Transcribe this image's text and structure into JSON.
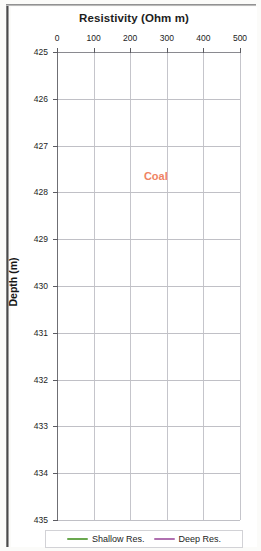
{
  "figure": {
    "title": "Resistivity (Ohm m)",
    "y_axis_title": "Depth (m)",
    "annotation": "Coal"
  },
  "legend": {
    "items": [
      {
        "label": "Shallow Res.",
        "color": "#6aa84f"
      },
      {
        "label": "Deep Res.",
        "color": "#b070b0"
      }
    ]
  },
  "colors": {
    "shallow": "#6aa84f",
    "deep": "#b070b0",
    "coal_marker": "#ef7f52",
    "coal_text": "#ef8363",
    "grid": "#c5c5cb",
    "axis": "#6f6f74"
  },
  "chart_data": {
    "type": "line",
    "title": "Resistivity (Ohm m)",
    "xlabel": "Resistivity (Ohm m)",
    "ylabel": "Depth (m)",
    "orientation": "vertical-depth",
    "xlim": [
      0,
      500
    ],
    "ylim": [
      425,
      435
    ],
    "y_inverted": true,
    "xticks": [
      0,
      100,
      200,
      300,
      400,
      500
    ],
    "yticks": [
      425,
      426,
      427,
      428,
      429,
      430,
      431,
      432,
      433,
      434,
      435
    ],
    "grid": true,
    "legend_position": "bottom",
    "annotations": [
      {
        "text": "Coal",
        "x": 270,
        "y": 427.65,
        "color": "#ef8363"
      }
    ],
    "marker_lines": [
      {
        "name": "coal-top",
        "depth": 426.85,
        "color": "#ef7f52"
      },
      {
        "name": "coal-base",
        "depth": 432.45,
        "color": "#ef7f52"
      }
    ],
    "series": [
      {
        "name": "Shallow Res.",
        "color": "#6aa84f",
        "points": [
          [
            6,
            425.0
          ],
          [
            6,
            426.0
          ],
          [
            6,
            427.0
          ],
          [
            7,
            427.6
          ],
          [
            7,
            427.95
          ],
          [
            10,
            428.05
          ],
          [
            22,
            428.12
          ],
          [
            46,
            428.18
          ],
          [
            70,
            428.24
          ],
          [
            96,
            428.32
          ],
          [
            120,
            428.42
          ],
          [
            140,
            428.55
          ],
          [
            155,
            428.7
          ],
          [
            168,
            428.88
          ],
          [
            178,
            429.02
          ],
          [
            188,
            429.15
          ],
          [
            196,
            429.28
          ],
          [
            205,
            429.4
          ],
          [
            214,
            429.5
          ],
          [
            226,
            429.58
          ],
          [
            240,
            429.66
          ],
          [
            258,
            429.74
          ],
          [
            276,
            429.82
          ],
          [
            292,
            429.9
          ],
          [
            306,
            429.98
          ],
          [
            318,
            430.06
          ],
          [
            330,
            430.14
          ],
          [
            340,
            430.22
          ],
          [
            348,
            430.3
          ],
          [
            354,
            430.38
          ],
          [
            357,
            430.46
          ],
          [
            356,
            430.54
          ],
          [
            350,
            430.62
          ],
          [
            340,
            430.7
          ],
          [
            326,
            430.78
          ],
          [
            310,
            430.86
          ],
          [
            294,
            430.94
          ],
          [
            280,
            431.02
          ],
          [
            268,
            431.1
          ],
          [
            258,
            431.18
          ],
          [
            250,
            431.26
          ],
          [
            246,
            431.34
          ],
          [
            248,
            431.4
          ],
          [
            256,
            431.46
          ],
          [
            266,
            431.52
          ],
          [
            272,
            431.56
          ],
          [
            268,
            431.6
          ],
          [
            256,
            431.64
          ],
          [
            244,
            431.68
          ],
          [
            236,
            431.72
          ],
          [
            238,
            431.76
          ],
          [
            248,
            431.8
          ],
          [
            262,
            431.84
          ],
          [
            274,
            431.88
          ],
          [
            278,
            431.92
          ],
          [
            272,
            431.96
          ],
          [
            258,
            432.0
          ],
          [
            238,
            432.06
          ],
          [
            210,
            432.12
          ],
          [
            178,
            432.18
          ],
          [
            146,
            432.24
          ],
          [
            112,
            432.3
          ],
          [
            76,
            432.36
          ],
          [
            44,
            432.4
          ],
          [
            22,
            432.44
          ],
          [
            12,
            432.48
          ],
          [
            9,
            432.55
          ],
          [
            8,
            432.7
          ],
          [
            8,
            433.0
          ],
          [
            8,
            433.5
          ],
          [
            8,
            434.0
          ],
          [
            8,
            434.5
          ],
          [
            8,
            435.0
          ]
        ]
      },
      {
        "name": "Deep Res.",
        "color": "#b070b0",
        "points": [
          [
            5,
            425.0
          ],
          [
            5,
            426.0
          ],
          [
            5,
            427.0
          ],
          [
            6,
            427.6
          ],
          [
            6,
            427.95
          ],
          [
            9,
            428.05
          ],
          [
            20,
            428.1
          ],
          [
            40,
            428.15
          ],
          [
            58,
            428.2
          ],
          [
            72,
            428.28
          ],
          [
            82,
            428.38
          ],
          [
            90,
            428.5
          ],
          [
            96,
            428.62
          ],
          [
            102,
            428.74
          ],
          [
            110,
            428.84
          ],
          [
            118,
            428.92
          ],
          [
            124,
            429.0
          ],
          [
            128,
            429.1
          ],
          [
            132,
            429.22
          ],
          [
            138,
            429.34
          ],
          [
            144,
            429.46
          ],
          [
            150,
            429.58
          ],
          [
            156,
            429.7
          ],
          [
            162,
            429.82
          ],
          [
            168,
            429.94
          ],
          [
            174,
            430.04
          ],
          [
            180,
            430.14
          ],
          [
            186,
            430.22
          ],
          [
            190,
            430.3
          ],
          [
            192,
            430.38
          ],
          [
            190,
            430.46
          ],
          [
            184,
            430.54
          ],
          [
            176,
            430.62
          ],
          [
            168,
            430.7
          ],
          [
            162,
            430.78
          ],
          [
            158,
            430.86
          ],
          [
            156,
            430.94
          ],
          [
            158,
            431.02
          ],
          [
            164,
            431.1
          ],
          [
            172,
            431.18
          ],
          [
            182,
            431.26
          ],
          [
            192,
            431.32
          ],
          [
            196,
            431.38
          ],
          [
            192,
            431.44
          ],
          [
            182,
            431.5
          ],
          [
            172,
            431.55
          ],
          [
            168,
            431.6
          ],
          [
            176,
            431.64
          ],
          [
            194,
            431.68
          ],
          [
            222,
            431.72
          ],
          [
            258,
            431.76
          ],
          [
            300,
            431.79
          ],
          [
            345,
            431.82
          ],
          [
            390,
            431.84
          ],
          [
            428,
            431.86
          ],
          [
            450,
            431.88
          ],
          [
            455,
            431.9
          ],
          [
            442,
            431.93
          ],
          [
            412,
            431.96
          ],
          [
            372,
            432.0
          ],
          [
            326,
            432.04
          ],
          [
            278,
            432.08
          ],
          [
            232,
            432.12
          ],
          [
            190,
            432.16
          ],
          [
            152,
            432.2
          ],
          [
            118,
            432.24
          ],
          [
            88,
            432.28
          ],
          [
            62,
            432.32
          ],
          [
            40,
            432.36
          ],
          [
            24,
            432.4
          ],
          [
            14,
            432.44
          ],
          [
            10,
            432.48
          ],
          [
            9,
            432.55
          ],
          [
            9,
            432.8
          ],
          [
            9,
            433.2
          ],
          [
            9,
            433.6
          ],
          [
            9,
            434.0
          ],
          [
            9,
            434.4
          ],
          [
            9,
            434.8
          ],
          [
            9,
            435.0
          ]
        ]
      }
    ]
  }
}
